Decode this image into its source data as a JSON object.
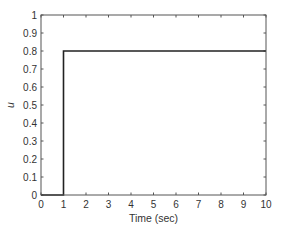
{
  "chart_data": {
    "type": "line",
    "title": "",
    "xlabel": "Time (sec)",
    "ylabel": "u",
    "xlim": [
      0,
      10
    ],
    "ylim": [
      0,
      1
    ],
    "xticks": [
      0,
      1,
      2,
      3,
      4,
      5,
      6,
      7,
      8,
      9,
      10
    ],
    "xtick_labels": [
      "0",
      "1",
      "2",
      "3",
      "4",
      "5",
      "6",
      "7",
      "8",
      "9",
      "10"
    ],
    "yticks": [
      0,
      0.1,
      0.2,
      0.3,
      0.4,
      0.5,
      0.6,
      0.7,
      0.8,
      0.9,
      1
    ],
    "ytick_labels": [
      "0",
      "0.1",
      "0.2",
      "0.3",
      "0.4",
      "0.5",
      "0.6",
      "0.7",
      "0.8",
      "0.9",
      "1"
    ],
    "grid": false,
    "legend": "none",
    "series": [
      {
        "name": "u",
        "color": "#222222",
        "x": [
          0,
          1,
          1,
          10
        ],
        "y": [
          0,
          0,
          0.8,
          0.8
        ]
      }
    ]
  }
}
